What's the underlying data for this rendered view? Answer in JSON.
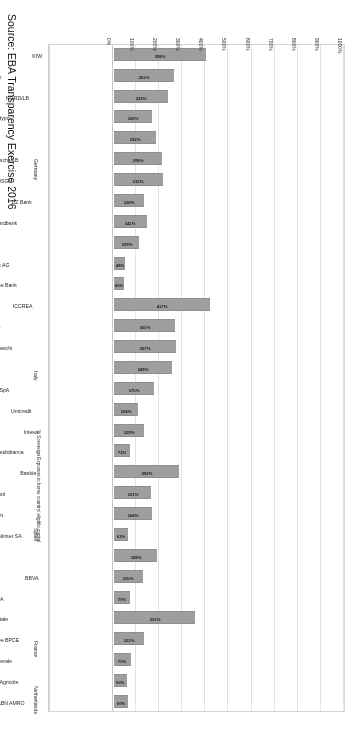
{
  "chart_data": {
    "type": "bar",
    "orientation": "horizontal",
    "title": "",
    "subtitle": "",
    "xlabel": "% Sovereign Exposure to home country/ eligible capital",
    "ylabel": "",
    "xlim": [
      0,
      1000
    ],
    "grid": true,
    "legend": "none",
    "tick_suffix": "%",
    "tick_labels": [
      "0%",
      "100%",
      "200%",
      "300%",
      "400%",
      "500%",
      "600%",
      "700%",
      "800%",
      "900%",
      "1000%"
    ],
    "tick_values": [
      0,
      100,
      200,
      300,
      400,
      500,
      600,
      700,
      800,
      900,
      1000
    ],
    "categories": [
      "ABN AMRO",
      "Credit Agricole",
      "Societe Generale",
      "Groupe BPCE",
      "La Banque Postale",
      "Banco Santander SA",
      "BBVA",
      "Banco de Sabadell, SA",
      "Bankinter SA",
      "Banco Mare Nostrum",
      "Banco Pop. Espanol",
      "Bankia",
      "Mediobanca",
      "Intesa",
      "Unicredit",
      "Banca Carige SpA",
      "Banca Pop. di Vicenza",
      "Monte dei Paschi",
      "Banca Pop. di Sondrio",
      "ICCREA",
      "Deutsche Bank",
      "Commerzbank AG",
      "LB Baden-Wuerttemberg",
      "HSH Nordbank",
      "DZ Bank",
      "DekaBank DSGV",
      "Bayerische LB",
      "LB Hessen-Thueringen",
      "Muenchener Hypo",
      "NORD/LB",
      "LKB BW-Foerderbank",
      "KfW"
    ],
    "values": [
      60,
      55,
      72,
      131,
      351,
      70,
      125,
      188,
      61,
      164,
      161,
      283,
      71,
      129,
      104,
      175,
      249,
      267,
      265,
      417,
      45,
      48,
      109,
      141,
      128,
      212,
      208,
      182,
      166,
      232,
      261,
      398
    ],
    "value_labels": [
      "60%",
      "55%",
      "72%",
      "131%",
      "351%",
      "70%",
      "125%",
      "188%",
      "61%",
      "164%",
      "161%",
      "283%",
      "71%",
      "129%",
      "104%",
      "175%",
      "249%",
      "267%",
      "265%",
      "417%",
      "45%",
      "48%",
      "109%",
      "141%",
      "128%",
      "212%",
      "208%",
      "182%",
      "166%",
      "232%",
      "261%",
      "398%"
    ],
    "groups": [
      {
        "label": "Netherlands",
        "start_index": 0,
        "end_index": 0
      },
      {
        "label": "France",
        "start_index": 1,
        "end_index": 4
      },
      {
        "label": "Spain",
        "start_index": 5,
        "end_index": 11
      },
      {
        "label": "Italy",
        "start_index": 12,
        "end_index": 19
      },
      {
        "label": "Germany",
        "start_index": 20,
        "end_index": 31
      }
    ],
    "bar_color": "#9e9e9e",
    "grid_color": "#e3e3e3"
  },
  "footer": {
    "source": "Source: EBA Transparency Exercise 2016"
  }
}
